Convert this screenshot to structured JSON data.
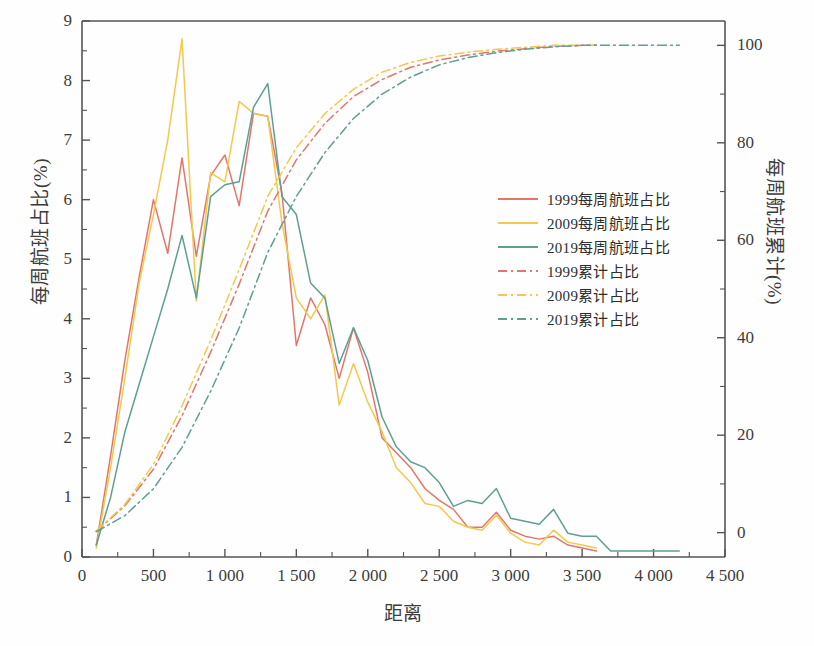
{
  "chart_data": {
    "type": "line",
    "title": "",
    "xlabel": "距离",
    "ylabel": "每周航班占比(%)",
    "y2label": "每周航班累计(%)",
    "xlim": [
      0,
      4500
    ],
    "ylim": [
      0,
      9
    ],
    "y2lim": [
      -5,
      105
    ],
    "grid": false,
    "legend_position": "center-right",
    "xticks": [
      "0",
      "500",
      "1 000",
      "1 500",
      "2 000",
      "2 500",
      "3 000",
      "3 500",
      "4 000",
      "4 500"
    ],
    "xtick_values": [
      0,
      500,
      1000,
      1500,
      2000,
      2500,
      3000,
      3500,
      4000,
      4500
    ],
    "yticks": [
      "0",
      "1",
      "2",
      "3",
      "4",
      "5",
      "6",
      "7",
      "8",
      "9"
    ],
    "ytick_values": [
      0,
      1,
      2,
      3,
      4,
      5,
      6,
      7,
      8,
      9
    ],
    "y2ticks": [
      "0",
      "20",
      "40",
      "60",
      "80",
      "100"
    ],
    "y2tick_values": [
      0,
      20,
      40,
      60,
      80,
      100
    ],
    "colors": {
      "1999": "#e0776a",
      "2009": "#f2c94c",
      "2019": "#5f9e92"
    },
    "series": [
      {
        "name": "1999每周航班占比",
        "legend_label": "1999每周航班占比",
        "axis": "left",
        "style": "solid",
        "color": "#e0776a",
        "x": [
          100,
          200,
          300,
          400,
          500,
          600,
          700,
          800,
          900,
          1000,
          1100,
          1200,
          1300,
          1400,
          1500,
          1600,
          1700,
          1800,
          1900,
          2000,
          2100,
          2200,
          2300,
          2400,
          2500,
          2600,
          2700,
          2800,
          2900,
          3000,
          3100,
          3200,
          3300,
          3400,
          3500,
          3600
        ],
        "y": [
          0.2,
          1.7,
          3.3,
          4.7,
          6.0,
          5.1,
          6.7,
          5.05,
          6.4,
          6.75,
          5.9,
          7.45,
          7.4,
          6.1,
          3.55,
          4.35,
          3.9,
          3.0,
          3.85,
          3.1,
          2.0,
          1.75,
          1.5,
          1.15,
          0.95,
          0.8,
          0.5,
          0.5,
          0.75,
          0.45,
          0.35,
          0.3,
          0.35,
          0.2,
          0.15,
          0.1
        ]
      },
      {
        "name": "2009每周航班占比",
        "legend_label": "2009每周航班占比",
        "axis": "left",
        "style": "solid",
        "color": "#f2c94c",
        "x": [
          100,
          200,
          300,
          400,
          500,
          600,
          700,
          800,
          900,
          1000,
          1100,
          1200,
          1300,
          1400,
          1500,
          1600,
          1700,
          1800,
          1900,
          2000,
          2100,
          2200,
          2300,
          2400,
          2500,
          2600,
          2700,
          2800,
          2900,
          3000,
          3100,
          3200,
          3300,
          3400,
          3500,
          3600
        ],
        "y": [
          0.15,
          1.5,
          3.0,
          4.6,
          5.75,
          7.0,
          8.7,
          4.3,
          6.45,
          6.3,
          7.65,
          7.45,
          7.4,
          5.6,
          4.35,
          4.0,
          4.4,
          2.55,
          3.25,
          2.6,
          2.1,
          1.5,
          1.25,
          0.9,
          0.85,
          0.6,
          0.5,
          0.45,
          0.7,
          0.4,
          0.25,
          0.2,
          0.45,
          0.25,
          0.2,
          0.15
        ]
      },
      {
        "name": "2019每周航班占比",
        "legend_label": "2019每周航班占比",
        "axis": "left",
        "style": "solid",
        "color": "#5f9e92",
        "x": [
          100,
          200,
          300,
          400,
          500,
          600,
          700,
          800,
          900,
          1000,
          1100,
          1200,
          1300,
          1400,
          1500,
          1600,
          1700,
          1800,
          1900,
          2000,
          2100,
          2200,
          2300,
          2400,
          2500,
          2600,
          2700,
          2800,
          2900,
          3000,
          3100,
          3200,
          3300,
          3400,
          3500,
          3600,
          3700,
          3800,
          3900,
          4000,
          4100,
          4180
        ],
        "y": [
          0.2,
          1.0,
          2.1,
          2.9,
          3.7,
          4.5,
          5.4,
          4.35,
          6.05,
          6.25,
          6.3,
          7.55,
          7.95,
          6.05,
          5.75,
          4.6,
          4.35,
          3.25,
          3.85,
          3.3,
          2.35,
          1.85,
          1.6,
          1.5,
          1.25,
          0.85,
          0.95,
          0.9,
          1.15,
          0.65,
          0.6,
          0.55,
          0.8,
          0.4,
          0.35,
          0.35,
          0.1,
          0.1,
          0.1,
          0.1,
          0.1,
          0.1
        ]
      },
      {
        "name": "1999累计占比",
        "legend_label": "1999累计占比",
        "axis": "right",
        "style": "dashdot",
        "color": "#e0776a",
        "x": [
          100,
          300,
          500,
          700,
          900,
          1100,
          1300,
          1500,
          1700,
          1900,
          2100,
          2300,
          2500,
          2700,
          2900,
          3100,
          3300,
          3500,
          3600
        ],
        "y": [
          0.3,
          5.5,
          13.0,
          24.0,
          37.0,
          51.0,
          66.0,
          76.5,
          84.0,
          89.5,
          93.0,
          95.5,
          97.0,
          98.0,
          98.8,
          99.3,
          99.8,
          100.0,
          100.0
        ]
      },
      {
        "name": "2009累计占比",
        "legend_label": "2009累计占比",
        "axis": "right",
        "style": "dashdot",
        "color": "#f2c94c",
        "x": [
          100,
          300,
          500,
          700,
          900,
          1100,
          1300,
          1500,
          1700,
          1900,
          2100,
          2300,
          2500,
          2700,
          2900,
          3100,
          3300,
          3500,
          3600
        ],
        "y": [
          0.3,
          5.8,
          14.0,
          26.0,
          39.5,
          54.0,
          69.0,
          79.0,
          86.0,
          91.0,
          94.5,
          96.5,
          97.8,
          98.6,
          99.2,
          99.6,
          100.0,
          100.0,
          100.0
        ]
      },
      {
        "name": "2019累计占比",
        "legend_label": "2019累计占比",
        "axis": "right",
        "style": "dashdot",
        "color": "#5f9e92",
        "x": [
          100,
          300,
          500,
          700,
          900,
          1100,
          1300,
          1500,
          1700,
          1900,
          2100,
          2300,
          2500,
          2700,
          2900,
          3100,
          3300,
          3500,
          3700,
          3900,
          4180
        ],
        "y": [
          0.2,
          3.5,
          9.0,
          17.5,
          29.0,
          42.0,
          57.5,
          69.0,
          78.0,
          85.0,
          90.0,
          93.5,
          96.0,
          97.5,
          98.5,
          99.2,
          99.7,
          100.0,
          100.0,
          100.0,
          100.0
        ]
      }
    ]
  }
}
